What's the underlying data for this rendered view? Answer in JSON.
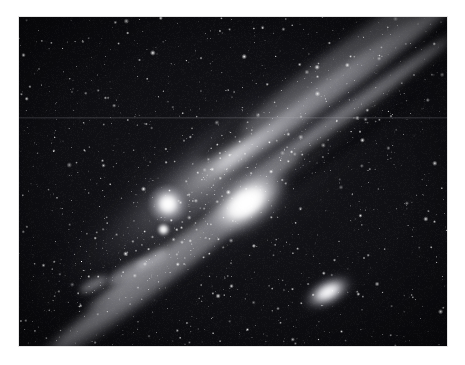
{
  "page": {
    "background_color": "#ffffff",
    "width": 465,
    "height": 365
  },
  "image": {
    "title": "Andromeda Galaxy (M31)",
    "alt_text": "Monochrome astrophotograph of the Andromeda Galaxy with companion galaxies M32 and M110 in a dense star field",
    "caption": "",
    "type": "photograph",
    "palette": "grayscale",
    "frame": {
      "left": 19,
      "top": 17,
      "width": 428,
      "height": 329,
      "border_color": "#d2d2d2",
      "background_color": "#07070a"
    },
    "colors": {
      "sky": "#0d0d11",
      "deep_sky": "#050507",
      "core_highlight": "#ffffff",
      "disk_midtone": "#9a9aa2",
      "dust_lane": "#06060a",
      "star": "#ffffff"
    },
    "objects": [
      {
        "name": "M31 nucleus",
        "label": "core",
        "x": 227,
        "y": 186,
        "brightness": "saturated-white"
      },
      {
        "name": "M32",
        "label": "companion-elliptical",
        "x": 149,
        "y": 187,
        "brightness": "very-bright"
      },
      {
        "name": "M110",
        "label": "companion-elliptical",
        "x": 309,
        "y": 275,
        "brightness": "bright"
      }
    ],
    "artifacts": [
      {
        "name": "horizontal scan line",
        "y": 117
      }
    ],
    "disk": {
      "position_angle_deg": -36,
      "major_axis_px": 505,
      "minor_axis_px": 99
    }
  }
}
